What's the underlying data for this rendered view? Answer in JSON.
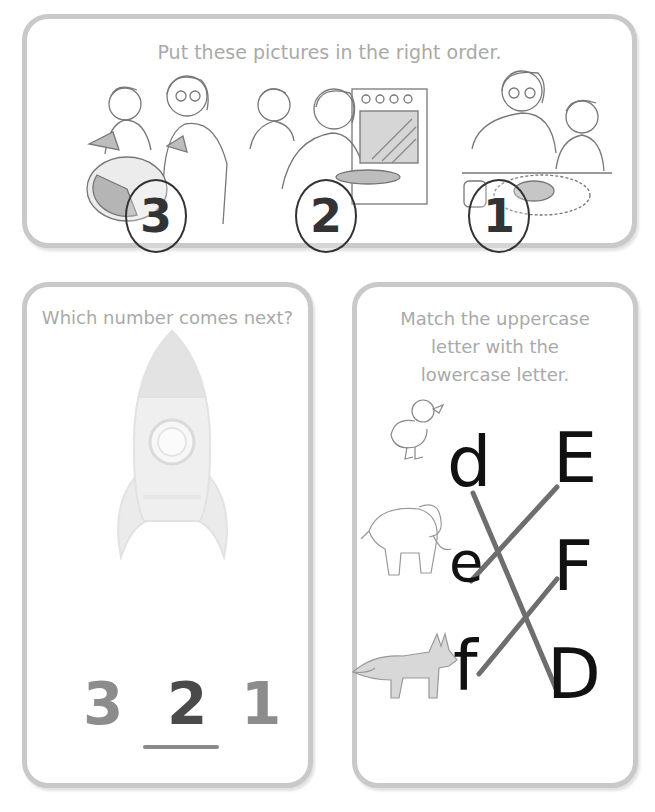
{
  "order_card": {
    "title": "Put these pictures in the right order.",
    "pictures": [
      {
        "scene": "eating-pie",
        "number": "3"
      },
      {
        "scene": "baking-pie-in-oven",
        "number": "2"
      },
      {
        "scene": "making-pie",
        "number": "1"
      }
    ]
  },
  "next_card": {
    "title": "Which number comes next?",
    "illustration": "rocket",
    "sequence": [
      "3",
      "2",
      "1"
    ],
    "answer_index": 1,
    "colors": {
      "faded": "#8c8c8c",
      "answer": "#4a4a4a",
      "line": "#8a8a8a"
    }
  },
  "match_card": {
    "title_lines": [
      "Match the uppercase",
      "letter with the",
      "lowercase letter."
    ],
    "lowercase": [
      "d",
      "e",
      "f"
    ],
    "uppercase": [
      "E",
      "F",
      "D"
    ],
    "animals": [
      "duck",
      "elephant",
      "fox"
    ],
    "matches": [
      {
        "from": "d",
        "to": "D"
      },
      {
        "from": "e",
        "to": "E"
      },
      {
        "from": "f",
        "to": "F"
      }
    ],
    "line_color": "#6e6e6e"
  },
  "colors": {
    "card_border": "#c9c9c9",
    "title_text": "#a9a9a9"
  }
}
